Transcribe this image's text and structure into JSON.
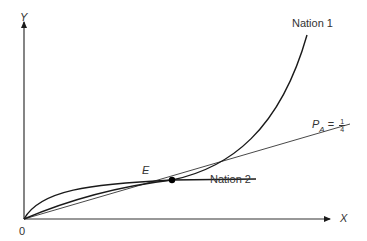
{
  "diagram": {
    "type": "economics-offer-curves",
    "axes": {
      "y_label": "Y",
      "x_label": "X",
      "origin_label": "0"
    },
    "curves": [
      {
        "name": "nation1",
        "label": "Nation 1"
      },
      {
        "name": "nation2",
        "label": "Nation 2"
      }
    ],
    "price_line": {
      "label_symbol": "P",
      "label_subscript": "A",
      "label_equals": "=",
      "fraction_numerator": "1",
      "fraction_denominator": "4"
    },
    "equilibrium_point": {
      "label": "E"
    },
    "colors": {
      "line": "#1a1a1a",
      "text": "#333333",
      "background": "#ffffff"
    }
  }
}
